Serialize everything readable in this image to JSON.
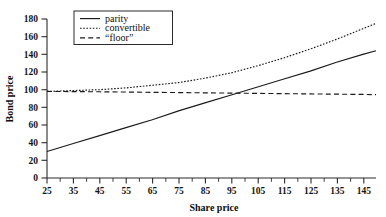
{
  "chart_data": {
    "type": "line",
    "title": "",
    "xlabel": "Share price",
    "ylabel": "Bond price",
    "xlim": [
      25,
      150
    ],
    "ylim": [
      0,
      180
    ],
    "ytick_step": 20,
    "xtick_step": 10,
    "xminor_step": 5,
    "grid": false,
    "legend_position": "top-center",
    "xticks": [
      25,
      35,
      45,
      55,
      65,
      75,
      85,
      95,
      105,
      115,
      125,
      135,
      145
    ],
    "yticks": [
      0,
      20,
      40,
      60,
      80,
      100,
      120,
      140,
      160,
      180
    ],
    "series": [
      {
        "name": "parity",
        "style": "solid",
        "x": [
          25,
          35,
          45,
          55,
          65,
          75,
          85,
          95,
          105,
          115,
          125,
          135,
          145,
          150
        ],
        "values": [
          30,
          39,
          48,
          57,
          66,
          76,
          85,
          94,
          103,
          112,
          121,
          131,
          140,
          144
        ]
      },
      {
        "name": "convertible",
        "style": "dotted",
        "x": [
          25,
          35,
          45,
          55,
          65,
          75,
          85,
          95,
          105,
          115,
          125,
          135,
          145,
          150
        ],
        "values": [
          98,
          99,
          100,
          102,
          105,
          108,
          113,
          119,
          127,
          136,
          146,
          157,
          169,
          175
        ]
      },
      {
        "name": "“floor”",
        "style": "dashed",
        "x": [
          25,
          35,
          45,
          55,
          65,
          75,
          85,
          95,
          105,
          115,
          125,
          135,
          145,
          150
        ],
        "values": [
          98,
          97.8,
          97.6,
          97.3,
          97.0,
          96.7,
          96.4,
          96.1,
          95.8,
          95.5,
          95.2,
          94.9,
          94.6,
          94.4
        ]
      }
    ]
  },
  "legend": {
    "items": [
      {
        "label": "parity",
        "style": "solid"
      },
      {
        "label": "convertible",
        "style": "dotted"
      },
      {
        "label": "“floor”",
        "style": "dashed"
      }
    ]
  },
  "axes": {
    "y_title": "Bond price",
    "x_title": "Share price",
    "y_labels": [
      "180",
      "160",
      "140",
      "120",
      "100",
      "80",
      "60",
      "40",
      "20",
      "0"
    ],
    "x_labels": [
      "25",
      "35",
      "45",
      "55",
      "65",
      "75",
      "85",
      "95",
      "105",
      "115",
      "125",
      "135",
      "145"
    ]
  },
  "colors": {
    "ink": "#1a1a1a",
    "background": "#ffffff"
  }
}
